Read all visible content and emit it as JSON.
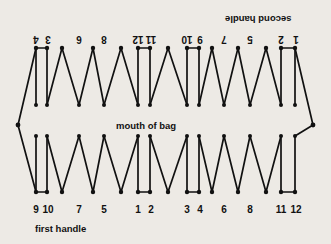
{
  "figure": {
    "background_color": "#edeae5",
    "ink_color": "#111111",
    "captions": {
      "mouth_of_bag": "mouth of bag",
      "first_handle": "first handle",
      "second_handle": "second handle"
    },
    "bottom_row": {
      "description": "station numbers along the bottom edge, left to right",
      "labels": [
        "9",
        "10",
        "7",
        "5",
        "1",
        "2",
        "3",
        "4",
        "6",
        "8",
        "11",
        "12"
      ],
      "x": [
        36,
        47,
        79,
        104,
        138,
        150,
        187,
        199,
        224,
        250,
        281,
        295
      ],
      "y": 205
    },
    "top_row": {
      "description": "station numbers along the top edge, printed upside down, left to right",
      "labels": [
        "4",
        "3",
        "6",
        "8",
        "12",
        "11",
        "10",
        "9",
        "7",
        "5",
        "2",
        "1"
      ],
      "x": [
        36,
        47,
        79,
        104,
        138,
        150,
        187,
        199,
        224,
        250,
        281,
        295
      ],
      "y": 38
    },
    "geometry": {
      "left_vertex": [
        18,
        125
      ],
      "right_vertex": [
        313,
        125
      ],
      "top_apex_y": 48,
      "top_valley_y": 105,
      "bottom_valley_y": 192,
      "bottom_peak_y": 136,
      "double_line_pairs": [
        [
          36,
          47
        ],
        [
          138,
          150
        ],
        [
          187,
          199
        ],
        [
          281,
          295
        ]
      ]
    }
  }
}
